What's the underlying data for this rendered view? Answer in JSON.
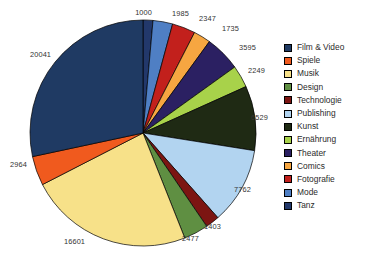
{
  "chart_data": {
    "type": "pie",
    "title": "",
    "subtitle": "",
    "xlabel": "",
    "ylabel": "",
    "legend_position": "right",
    "grid": false,
    "start_angle_deg": 0,
    "direction": "clockwise",
    "total": 70688,
    "categories": [
      "Tanz",
      "Mode",
      "Fotografie",
      "Comics",
      "Theater",
      "Ernährung",
      "Kunst",
      "Publishing",
      "Technologie",
      "Design",
      "Musik",
      "Spiele",
      "Film & Video"
    ],
    "values": [
      1000,
      1985,
      2347,
      1735,
      3595,
      2249,
      6529,
      7762,
      1403,
      2477,
      16601,
      2964,
      20041
    ],
    "colors": [
      "#22386b",
      "#4f7fc4",
      "#c2201c",
      "#f6a641",
      "#2b2062",
      "#a8d24a",
      "#1f2a14",
      "#b2d4f0",
      "#7c1512",
      "#5f8f42",
      "#f7e189",
      "#f05a1e",
      "#1f3a63"
    ],
    "slices": [
      {
        "label": "Tanz",
        "value": 1000,
        "color": "#22386b",
        "label_x": 152,
        "label_y": 9,
        "label_anchor": "end"
      },
      {
        "label": "Mode",
        "value": 1985,
        "color": "#4f7fc4",
        "label_x": 172,
        "label_y": 10,
        "label_anchor": "start"
      },
      {
        "label": "Fotografie",
        "value": 2347,
        "color": "#c2201c",
        "label_x": 199,
        "label_y": 15,
        "label_anchor": "start"
      },
      {
        "label": "Comics",
        "value": 1735,
        "color": "#f6a641",
        "label_x": 222,
        "label_y": 25,
        "label_anchor": "start"
      },
      {
        "label": "Theater",
        "value": 3595,
        "color": "#2b2062",
        "label_x": 239,
        "label_y": 44,
        "label_anchor": "start"
      },
      {
        "label": "Ernährung",
        "value": 2249,
        "color": "#a8d24a",
        "label_x": 248,
        "label_y": 67,
        "label_anchor": "start"
      },
      {
        "label": "Kunst",
        "value": 6529,
        "color": "#1f2a14",
        "label_x": 251,
        "label_y": 114,
        "label_anchor": "start"
      },
      {
        "label": "Publishing",
        "value": 7762,
        "color": "#b2d4f0",
        "label_x": 234,
        "label_y": 186,
        "label_anchor": "start"
      },
      {
        "label": "Technologie",
        "value": 1403,
        "color": "#7c1512",
        "label_x": 204,
        "label_y": 223,
        "label_anchor": "start"
      },
      {
        "label": "Design",
        "value": 2477,
        "color": "#5f8f42",
        "label_x": 182,
        "label_y": 235,
        "label_anchor": "start"
      },
      {
        "label": "Musik",
        "value": 16601,
        "color": "#f7e189",
        "label_x": 64,
        "label_y": 238,
        "label_anchor": "start"
      },
      {
        "label": "Spiele",
        "value": 2964,
        "color": "#f05a1e",
        "label_x": 10,
        "label_y": 161,
        "label_anchor": "start"
      },
      {
        "label": "Film & Video",
        "value": 20041,
        "color": "#1f3a63",
        "label_x": 30,
        "label_y": 51,
        "label_anchor": "start"
      }
    ],
    "geometry": {
      "center_x": 143,
      "center_y": 133,
      "radius": 113
    }
  },
  "legend": {
    "items": [
      {
        "label": "Film & Video",
        "color": "#1f3a63"
      },
      {
        "label": "Spiele",
        "color": "#f05a1e"
      },
      {
        "label": "Musik",
        "color": "#f7e189"
      },
      {
        "label": "Design",
        "color": "#5f8f42"
      },
      {
        "label": "Technologie",
        "color": "#7c1512"
      },
      {
        "label": "Publishing",
        "color": "#b2d4f0"
      },
      {
        "label": "Kunst",
        "color": "#1f2a14"
      },
      {
        "label": "Ernährung",
        "color": "#a8d24a"
      },
      {
        "label": "Theater",
        "color": "#2b2062"
      },
      {
        "label": "Comics",
        "color": "#f6a641"
      },
      {
        "label": "Fotografie",
        "color": "#c2201c"
      },
      {
        "label": "Mode",
        "color": "#4f7fc4"
      },
      {
        "label": "Tanz",
        "color": "#22386b"
      }
    ]
  }
}
